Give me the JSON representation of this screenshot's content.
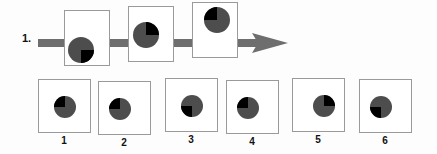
{
  "puzzle": {
    "question_number": "1.",
    "type": "visual-sequence-analogy",
    "colors": {
      "circle_body": "#4d4d4d",
      "quadrant_highlight": "#000000",
      "box_border": "#9a9a9a",
      "arrow": "#6e6e6e",
      "page_background": "#fdfdfd",
      "box_fill": "#ffffff",
      "text": "#111111"
    },
    "sequence": {
      "arrow_direction": "right",
      "arrow_label": "sequence-arrow",
      "cells": [
        {
          "id": "seq-1",
          "circle": {
            "dark_quadrant": "bottom-right",
            "position": "bottom-left",
            "radius": 13
          }
        },
        {
          "id": "seq-2",
          "circle": {
            "dark_quadrant": "top-right",
            "position": "middle-left",
            "radius": 13
          }
        },
        {
          "id": "seq-3",
          "circle": {
            "dark_quadrant": "top-left",
            "position": "top-center",
            "radius": 13
          }
        }
      ]
    },
    "options": [
      {
        "label": "1",
        "circle": {
          "dark_quadrant": "top-left",
          "position": "center",
          "radius": 11
        }
      },
      {
        "label": "2",
        "circle": {
          "dark_quadrant": "top-left",
          "position": "center-left",
          "radius": 11
        }
      },
      {
        "label": "3",
        "circle": {
          "dark_quadrant": "bottom-left",
          "position": "center",
          "radius": 11
        }
      },
      {
        "label": "4",
        "circle": {
          "dark_quadrant": "top-left",
          "position": "center-left",
          "radius": 11
        }
      },
      {
        "label": "5",
        "circle": {
          "dark_quadrant": "top-right",
          "position": "center-right",
          "radius": 11
        }
      },
      {
        "label": "6",
        "circle": {
          "dark_quadrant": "bottom-left",
          "position": "center-left",
          "radius": 11
        }
      }
    ]
  }
}
